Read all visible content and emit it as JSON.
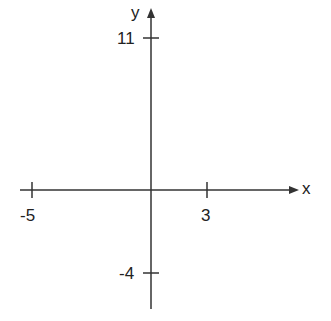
{
  "diagram": {
    "type": "coordinate-axes",
    "x_axis": {
      "label": "x",
      "ticks": [
        {
          "value": "-5"
        },
        {
          "value": "3"
        }
      ]
    },
    "y_axis": {
      "label": "y",
      "ticks": [
        {
          "value": "11"
        },
        {
          "value": "-4"
        }
      ]
    },
    "colors": {
      "line": "#333333",
      "text": "#222222"
    }
  }
}
